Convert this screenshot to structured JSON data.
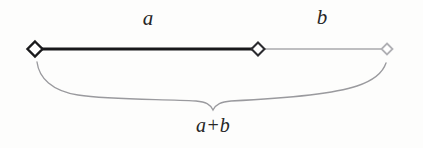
{
  "figure": {
    "background_color": "#fdfdfc",
    "labels": {
      "segment_a": "a",
      "segment_b": "b",
      "total": "a+b"
    },
    "colors": {
      "segment_a_stroke": "#18181a",
      "segment_b_stroke": "#a9a9ad",
      "marker_left_stroke": "#1a1a1c",
      "marker_middle_stroke": "#2b2b2f",
      "marker_right_stroke": "#b0b0b4",
      "marker_fill": "#ffffff",
      "brace_stroke": "#9a9a9e",
      "text_color": "#262626"
    },
    "geometry": {
      "baseline_y": 49,
      "left_endpoint_x": 35,
      "middle_endpoint_x": 258,
      "right_endpoint_x": 387,
      "segment_a_width": 223,
      "segment_b_width": 129,
      "brace_center_x": 213,
      "brace_bottom_y": 110
    }
  }
}
